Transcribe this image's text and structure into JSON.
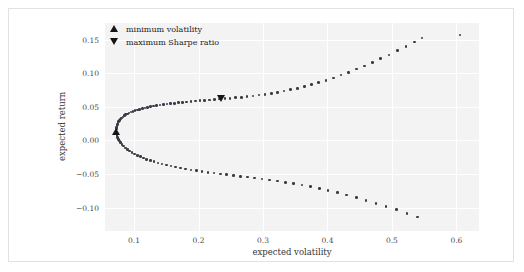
{
  "chart_data": {
    "type": "scatter",
    "title": "",
    "xlabel": "expected volatility",
    "ylabel": "expected return",
    "xlim": [
      0.055,
      0.635
    ],
    "ylim": [
      -0.135,
      0.175
    ],
    "xticks": [
      0.1,
      0.2,
      0.3,
      0.4,
      0.5,
      0.6
    ],
    "xtick_labels": [
      "0.1",
      "0.2",
      "0.3",
      "0.4",
      "0.5",
      "0.6"
    ],
    "yticks": [
      0.15,
      0.1,
      0.05,
      0.0,
      -0.05,
      -0.1
    ],
    "ytick_labels": [
      "0.15",
      "0.10",
      "0.05",
      "0.00",
      "−0.05",
      "−0.10"
    ],
    "grid": true,
    "legend_position": "top-left",
    "series": [
      {
        "name": "efficient frontier upper branch",
        "marker": "circle",
        "color": "#3b3b46",
        "points": [
          [
            0.0722,
            0.014
          ],
          [
            0.0725,
            0.0168
          ],
          [
            0.0729,
            0.0193
          ],
          [
            0.0735,
            0.0215
          ],
          [
            0.0743,
            0.0238
          ],
          [
            0.0752,
            0.0259
          ],
          [
            0.0763,
            0.028
          ],
          [
            0.0776,
            0.03
          ],
          [
            0.0791,
            0.0318
          ],
          [
            0.0808,
            0.0335
          ],
          [
            0.0827,
            0.0352
          ],
          [
            0.0848,
            0.0367
          ],
          [
            0.0871,
            0.0382
          ],
          [
            0.0896,
            0.0396
          ],
          [
            0.0923,
            0.0409
          ],
          [
            0.0952,
            0.0421
          ],
          [
            0.0983,
            0.0433
          ],
          [
            0.1016,
            0.0444
          ],
          [
            0.1051,
            0.0455
          ],
          [
            0.1088,
            0.0465
          ],
          [
            0.1127,
            0.0475
          ],
          [
            0.1168,
            0.0484
          ],
          [
            0.1211,
            0.0493
          ],
          [
            0.1256,
            0.0502
          ],
          [
            0.1303,
            0.051
          ],
          [
            0.1352,
            0.0518
          ],
          [
            0.1403,
            0.0526
          ],
          [
            0.1456,
            0.0533
          ],
          [
            0.1511,
            0.0541
          ],
          [
            0.1568,
            0.0548
          ],
          [
            0.1627,
            0.0554
          ],
          [
            0.1688,
            0.0561
          ],
          [
            0.1751,
            0.0567
          ],
          [
            0.1816,
            0.0574
          ],
          [
            0.1883,
            0.058
          ],
          [
            0.1952,
            0.0586
          ],
          [
            0.2023,
            0.0592
          ],
          [
            0.2096,
            0.0598
          ],
          [
            0.2171,
            0.0604
          ],
          [
            0.2248,
            0.061
          ],
          [
            0.2327,
            0.0616
          ],
          [
            0.2408,
            0.0622
          ],
          [
            0.2491,
            0.0629
          ],
          [
            0.2576,
            0.0636
          ],
          [
            0.2663,
            0.0644
          ],
          [
            0.2752,
            0.0653
          ],
          [
            0.2843,
            0.0663
          ],
          [
            0.2936,
            0.0674
          ],
          [
            0.3031,
            0.0687
          ],
          [
            0.3128,
            0.0701
          ],
          [
            0.3227,
            0.0717
          ],
          [
            0.3328,
            0.0735
          ],
          [
            0.3431,
            0.0755
          ],
          [
            0.3536,
            0.0778
          ],
          [
            0.3643,
            0.0803
          ],
          [
            0.3752,
            0.0831
          ],
          [
            0.3863,
            0.0862
          ],
          [
            0.3976,
            0.0896
          ],
          [
            0.4091,
            0.0933
          ],
          [
            0.4208,
            0.0973
          ],
          [
            0.4327,
            0.1016
          ],
          [
            0.4448,
            0.1062
          ],
          [
            0.4571,
            0.1111
          ],
          [
            0.4696,
            0.1163
          ],
          [
            0.4823,
            0.1218
          ],
          [
            0.4952,
            0.1276
          ],
          [
            0.5083,
            0.1337
          ],
          [
            0.5216,
            0.1401
          ],
          [
            0.5351,
            0.1468
          ],
          [
            0.5463,
            0.1527
          ]
        ]
      },
      {
        "name": "efficient frontier lower branch",
        "marker": "circle",
        "color": "#3b3b46",
        "points": [
          [
            0.0722,
            0.0122
          ],
          [
            0.0726,
            0.0096
          ],
          [
            0.0733,
            0.007
          ],
          [
            0.0743,
            0.0044
          ],
          [
            0.0756,
            0.0018
          ],
          [
            0.0772,
            -0.0008
          ],
          [
            0.0791,
            -0.0034
          ],
          [
            0.0813,
            -0.006
          ],
          [
            0.0838,
            -0.0085
          ],
          [
            0.0866,
            -0.011
          ],
          [
            0.0897,
            -0.0134
          ],
          [
            0.0931,
            -0.0157
          ],
          [
            0.0968,
            -0.018
          ],
          [
            0.1008,
            -0.0202
          ],
          [
            0.1051,
            -0.0223
          ],
          [
            0.1097,
            -0.0243
          ],
          [
            0.1146,
            -0.0263
          ],
          [
            0.1198,
            -0.0282
          ],
          [
            0.1253,
            -0.03
          ],
          [
            0.1311,
            -0.0318
          ],
          [
            0.1372,
            -0.0335
          ],
          [
            0.1436,
            -0.0351
          ],
          [
            0.1503,
            -0.0367
          ],
          [
            0.1573,
            -0.0382
          ],
          [
            0.1646,
            -0.0397
          ],
          [
            0.1722,
            -0.0411
          ],
          [
            0.1801,
            -0.0425
          ],
          [
            0.1883,
            -0.0438
          ],
          [
            0.1968,
            -0.0451
          ],
          [
            0.2056,
            -0.0464
          ],
          [
            0.2147,
            -0.0476
          ],
          [
            0.2241,
            -0.0488
          ],
          [
            0.2338,
            -0.05
          ],
          [
            0.2438,
            -0.0512
          ],
          [
            0.2541,
            -0.0524
          ],
          [
            0.2647,
            -0.0536
          ],
          [
            0.2756,
            -0.0548
          ],
          [
            0.2868,
            -0.0561
          ],
          [
            0.2983,
            -0.0575
          ],
          [
            0.3101,
            -0.059
          ],
          [
            0.3222,
            -0.0606
          ],
          [
            0.3346,
            -0.0624
          ],
          [
            0.3473,
            -0.0644
          ],
          [
            0.3603,
            -0.0666
          ],
          [
            0.3736,
            -0.069
          ],
          [
            0.3872,
            -0.0717
          ],
          [
            0.4011,
            -0.0746
          ],
          [
            0.4153,
            -0.0778
          ],
          [
            0.4298,
            -0.0813
          ],
          [
            0.4446,
            -0.0851
          ],
          [
            0.4597,
            -0.0892
          ],
          [
            0.4751,
            -0.0936
          ],
          [
            0.4908,
            -0.0983
          ],
          [
            0.5068,
            -0.1033
          ],
          [
            0.5231,
            -0.1086
          ],
          [
            0.5397,
            -0.1142
          ]
        ]
      },
      {
        "name": "outlier",
        "marker": "circle",
        "color": "#3b3b46",
        "points": [
          [
            0.6053,
            0.157
          ]
        ]
      }
    ],
    "annotations": [
      {
        "label": "minimum volatility",
        "marker": "triangle-up",
        "color": "#151515",
        "x": 0.0722,
        "y": 0.0131
      },
      {
        "label": "maximum Sharpe ratio",
        "marker": "triangle-down",
        "color": "#151515",
        "x": 0.2352,
        "y": 0.0626
      }
    ]
  },
  "legend": {
    "entries": [
      {
        "label": "minimum volatility",
        "marker": "triangle-up"
      },
      {
        "label": "maximum Sharpe ratio",
        "marker": "triangle-down"
      }
    ]
  }
}
